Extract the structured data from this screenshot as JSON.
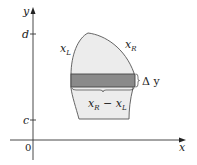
{
  "diagram": {
    "type": "region-between-curves-horizontal-strip",
    "axes": {
      "x_label": "x",
      "y_label": "y",
      "origin_label": "0"
    },
    "ticks": {
      "y_upper": "d",
      "y_lower": "c"
    },
    "curves": {
      "left": "x",
      "left_sub": "L",
      "right": "x",
      "right_sub": "R"
    },
    "strip": {
      "height_label": "Δ y",
      "width_label_a": "x",
      "width_label_a_sub": "R",
      "width_label_minus": " − ",
      "width_label_b": "x",
      "width_label_b_sub": "L"
    },
    "colors": {
      "region_fill": "#ececec",
      "strip_fill": "#8a8a8a",
      "outline": "#555555",
      "axis": "#333333"
    }
  }
}
